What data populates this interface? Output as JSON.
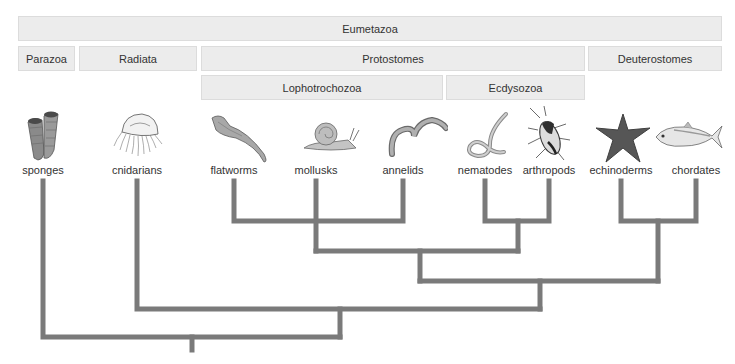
{
  "clade_bands": {
    "eumetazoa": "Eumetazoa",
    "parazoa": "Parazoa",
    "radiata": "Radiata",
    "protostomes": "Protostomes",
    "deuterostomes": "Deuterostomes",
    "lophotrochozoa": "Lophotrochozoa",
    "ecdysozoa": "Ecdysozoa"
  },
  "taxa": [
    {
      "label": "sponges",
      "icon": "sponge-icon"
    },
    {
      "label": "cnidarians",
      "icon": "jellyfish-icon"
    },
    {
      "label": "flatworms",
      "icon": "flatworm-icon"
    },
    {
      "label": "mollusks",
      "icon": "snail-icon"
    },
    {
      "label": "annelids",
      "icon": "earthworm-icon"
    },
    {
      "label": "nematodes",
      "icon": "roundworm-icon"
    },
    {
      "label": "arthropods",
      "icon": "beetle-icon"
    },
    {
      "label": "echinoderms",
      "icon": "starfish-icon"
    },
    {
      "label": "chordates",
      "icon": "fish-icon"
    }
  ],
  "tree": {
    "line_color": "#7a7a7a",
    "band_color": "#ececec",
    "topology": "(sponges,(cnidarians,(((flatworms,mollusks,annelids),(nematodes,arthropods)),(echinoderms,chordates))))"
  }
}
